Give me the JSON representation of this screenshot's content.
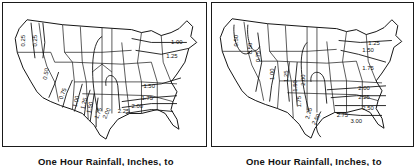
{
  "figure": {
    "panels": [
      {
        "id": "left",
        "caption": "One Hour Rainfall, Inches, to",
        "map": "Continental United States with state boundaries",
        "isoline_labels": [
          "0.25",
          "0.25",
          "0.50",
          "0.75",
          "1.00",
          "1.25",
          "1.50",
          "1.75",
          "2.00",
          "2.25",
          "1.00",
          "1.25",
          "1.50",
          "1.75",
          "2.00"
        ]
      },
      {
        "id": "right",
        "caption": "One Hour Rainfall, Inches, to",
        "map": "Continental United States with state boundaries",
        "isoline_labels": [
          "0.50",
          "0.50",
          "0.75",
          "1.00",
          "1.25",
          "1.50",
          "2.00",
          "1.75",
          "2.25",
          "2.50",
          "1.25",
          "1.50",
          "1.75",
          "2.00",
          "2.25",
          "2.50",
          "2.75",
          "3.00"
        ]
      }
    ],
    "colors": {
      "ink": "#111111",
      "background": "#ffffff"
    }
  }
}
